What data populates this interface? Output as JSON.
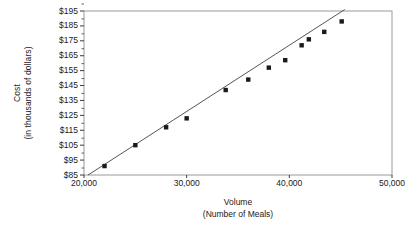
{
  "chart_data": {
    "type": "scatter",
    "title": "",
    "xlabel": "Volume",
    "xlabel_sub": "(Number of Meals)",
    "ylabel": "Cost",
    "ylabel_sub": "(in thousands of dollars)",
    "xlim": [
      20000,
      50000
    ],
    "ylim": [
      85,
      195
    ],
    "xticks": [
      20000,
      30000,
      40000,
      50000
    ],
    "xtick_labels": [
      "20,000",
      "30,000",
      "40,000",
      "50,000"
    ],
    "yticks": [
      85,
      95,
      105,
      115,
      125,
      135,
      145,
      155,
      165,
      175,
      185,
      195
    ],
    "ytick_labels": [
      "$85",
      "$95",
      "$105",
      "$115",
      "$125",
      "$135",
      "$145",
      "$155",
      "$165",
      "$175",
      "$185",
      "$195"
    ],
    "grid": false,
    "legend": false,
    "marker": "filled-square",
    "marker_color": "#1a1a1a",
    "line_color": "#555555",
    "frame_color": "#9a9a9a",
    "points": [
      {
        "x": 22000,
        "y": 91
      },
      {
        "x": 25000,
        "y": 105
      },
      {
        "x": 28000,
        "y": 117
      },
      {
        "x": 30000,
        "y": 123
      },
      {
        "x": 33800,
        "y": 142
      },
      {
        "x": 36000,
        "y": 149
      },
      {
        "x": 38000,
        "y": 157
      },
      {
        "x": 39600,
        "y": 162
      },
      {
        "x": 41200,
        "y": 172
      },
      {
        "x": 41900,
        "y": 176
      },
      {
        "x": 43400,
        "y": 181
      },
      {
        "x": 45100,
        "y": 188
      }
    ],
    "trendline": {
      "x0": 20400,
      "y0": 85,
      "x1": 45400,
      "y1": 196
    }
  }
}
